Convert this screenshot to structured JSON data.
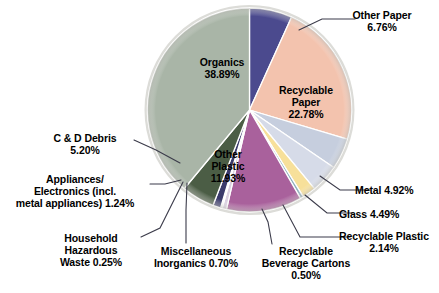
{
  "chart_data": {
    "type": "pie",
    "title": "",
    "subtitle": "",
    "xlabel": "",
    "ylabel": "",
    "legend_position": "none",
    "labels_position": "callout-and-inside",
    "units": "percent",
    "total": 100.0,
    "categories": [
      "Other Paper",
      "Recyclable Paper",
      "Metal",
      "Glass",
      "Recyclable Plastic",
      "Recyclable Beverage Cartons",
      "Other Plastic",
      "Miscellaneous Inorganics",
      "Household Hazardous Waste",
      "Appliances/Electronics (incl. metal appliances)",
      "C & D Debris",
      "Organics"
    ],
    "values": [
      6.76,
      22.78,
      4.92,
      4.49,
      2.14,
      0.5,
      11.93,
      0.7,
      0.25,
      1.24,
      5.2,
      38.89
    ],
    "colors": [
      "#4b4a8e",
      "#f3c3ae",
      "#c6cede",
      "#d6dbe8",
      "#f7e09a",
      "#8fb0bd",
      "#a9619c",
      "#d9cfe0",
      "#e7e0ec",
      "#3a3a6b",
      "#4b5d45",
      "#a9b5a7"
    ],
    "slices": [
      {
        "name": "Other Paper",
        "value": 6.76,
        "color": "#4b4a8e",
        "label_text": "Other Paper\n6.76%",
        "label_placement": "callout"
      },
      {
        "name": "Recyclable Paper",
        "value": 22.78,
        "color": "#f3c3ae",
        "label_text": "Recyclable\nPaper\n22.78%",
        "label_placement": "inside"
      },
      {
        "name": "Metal",
        "value": 4.92,
        "color": "#c6cede",
        "label_text": "Metal 4.92%",
        "label_placement": "callout"
      },
      {
        "name": "Glass",
        "value": 4.49,
        "color": "#d6dbe8",
        "label_text": "Glass 4.49%",
        "label_placement": "callout"
      },
      {
        "name": "Recyclable Plastic",
        "value": 2.14,
        "color": "#f7e09a",
        "label_text": "Recyclable Plastic\n2.14%",
        "label_placement": "callout"
      },
      {
        "name": "Recyclable Beverage Cartons",
        "value": 0.5,
        "color": "#8fb0bd",
        "label_text": "Recyclable\nBeverage Cartons\n0.50%",
        "label_placement": "callout"
      },
      {
        "name": "Other Plastic",
        "value": 11.93,
        "color": "#a9619c",
        "label_text": "Other\nPlastic\n11.93%",
        "label_placement": "inside"
      },
      {
        "name": "Miscellaneous Inorganics",
        "value": 0.7,
        "color": "#d9cfe0",
        "label_text": "Miscellaneous\nInorganics 0.70%",
        "label_placement": "callout"
      },
      {
        "name": "Household Hazardous Waste",
        "value": 0.25,
        "color": "#e7e0ec",
        "label_text": "Household\nHazardous\nWaste 0.25%",
        "label_placement": "callout"
      },
      {
        "name": "Appliances/Electronics (incl. metal appliances)",
        "value": 1.24,
        "color": "#3a3a6b",
        "label_text": "Appliances/\nElectronics (incl.\nmetal appliances) 1.24%",
        "label_placement": "callout"
      },
      {
        "name": "C & D Debris",
        "value": 5.2,
        "color": "#4b5d45",
        "label_text": "C & D Debris\n5.20%",
        "label_placement": "callout"
      },
      {
        "name": "Organics",
        "value": 38.89,
        "color": "#a9b5a7",
        "label_text": "Organics\n38.89%",
        "label_placement": "inside"
      }
    ]
  },
  "labels": {
    "organics": "Organics\n38.89%",
    "recyclable_paper": "Recyclable\nPaper\n22.78%",
    "other_plastic": "Other\nPlastic\n11.93%",
    "other_paper": "Other Paper\n6.76%",
    "cd_debris": "C & D Debris\n5.20%",
    "appliances": "Appliances/\nElectronics (incl.\nmetal appliances) 1.24%",
    "household_hazardous_waste": "Household\nHazardous\nWaste 0.25%",
    "miscellaneous_inorganics": "Miscellaneous\nInorganics 0.70%",
    "recyclable_beverage_cartons": "Recyclable\nBeverage Cartons\n0.50%",
    "metal": "Metal 4.92%",
    "glass": "Glass 4.49%",
    "recyclable_plastic": "Recyclable Plastic\n2.14%"
  },
  "style": {
    "background": "#ffffff",
    "text_color": "#000000",
    "slice_border": "#ffffff",
    "leader_line": "#3b3b4a",
    "pie_rim": "#d2d2cf"
  }
}
